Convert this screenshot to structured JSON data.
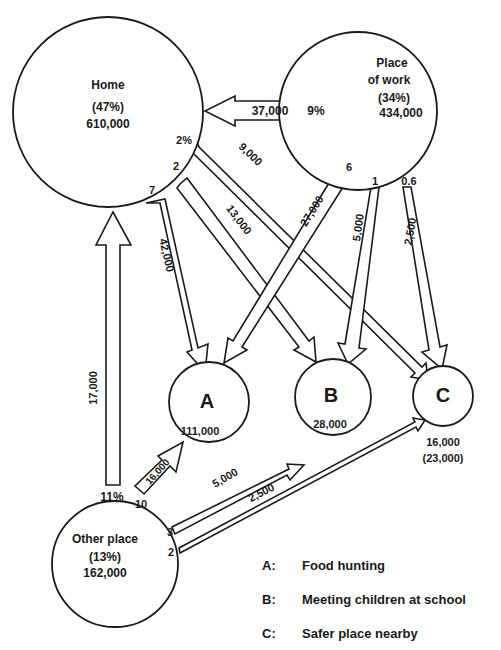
{
  "nodes": {
    "home": {
      "name": "Home",
      "pct": "(47%)",
      "value": "610,000"
    },
    "work": {
      "name_line1": "Place",
      "name_line2": "of work",
      "pct": "(34%)",
      "value": "434,000"
    },
    "other": {
      "name": "Other place",
      "pct": "(13%)",
      "value": "162,000"
    },
    "a": {
      "letter": "A",
      "value": "111,000"
    },
    "b": {
      "letter": "B",
      "value": "28,000"
    },
    "c": {
      "letter": "C",
      "value": "16,000",
      "value_alt": "(23,000)"
    }
  },
  "flows": {
    "work_to_home": {
      "value": "37,000",
      "pct": "9%"
    },
    "home_to_c": {
      "value": "9,000",
      "pct": "2%"
    },
    "home_to_b": {
      "value": "13,000",
      "pct": "2"
    },
    "home_to_a": {
      "value": "42,000",
      "pct": "7"
    },
    "work_to_a": {
      "value": "27,000",
      "pct": "6"
    },
    "work_to_b": {
      "value": "5,000",
      "pct": "1"
    },
    "work_to_c": {
      "value": "2,500",
      "pct": "0.6"
    },
    "other_to_home": {
      "value": "17,000",
      "pct": "11%"
    },
    "other_to_a": {
      "value": "16,000",
      "pct": "10"
    },
    "other_to_b": {
      "value": "5,000",
      "pct": "3"
    },
    "other_to_c": {
      "value": "2,500",
      "pct": "2"
    }
  },
  "legend": [
    {
      "key": "A:",
      "label": "Food hunting"
    },
    {
      "key": "B:",
      "label": "Meeting children at school"
    },
    {
      "key": "C:",
      "label": "Safer place nearby"
    }
  ]
}
